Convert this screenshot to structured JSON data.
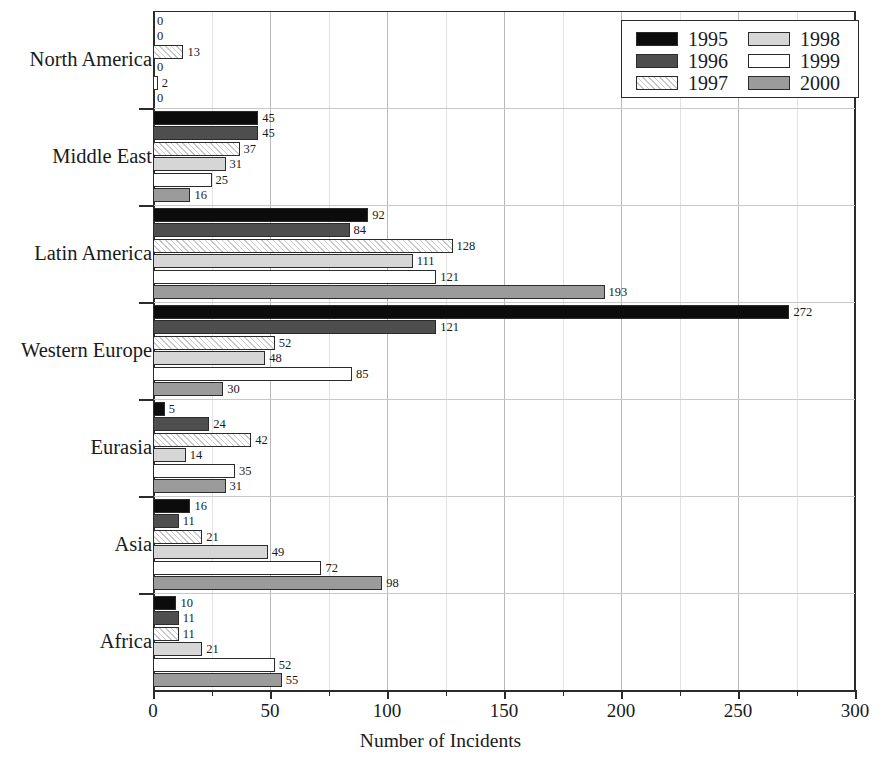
{
  "chart_data": {
    "type": "bar",
    "orientation": "horizontal",
    "title": "",
    "xlabel": "Number of Incidents",
    "ylabel": "",
    "xlim": [
      0,
      300
    ],
    "xticks": [
      0,
      50,
      100,
      150,
      200,
      250,
      300
    ],
    "xtick_labels": [
      "0",
      "50",
      "100",
      "150",
      "200",
      "250",
      "300"
    ],
    "minor_xticks": [
      25,
      75,
      125,
      175,
      225,
      275
    ],
    "grid": true,
    "legend_position": "top-right",
    "categories": [
      "North America",
      "Middle East",
      "Latin America",
      "Western Europe",
      "Eurasia",
      "Asia",
      "Africa"
    ],
    "series": [
      {
        "name": "1995",
        "color": "#0c0c0c",
        "pattern": "solid-black",
        "values": [
          0,
          45,
          92,
          272,
          5,
          16,
          10
        ]
      },
      {
        "name": "1996",
        "color": "#4e4e4e",
        "pattern": "solid-dark-gray",
        "values": [
          0,
          45,
          84,
          121,
          24,
          11,
          11
        ]
      },
      {
        "name": "1997",
        "color": "#ffffff",
        "pattern": "diagonal-hatch",
        "values": [
          13,
          37,
          128,
          52,
          42,
          21,
          11
        ]
      },
      {
        "name": "1998",
        "color": "#d6d6d6",
        "pattern": "solid-light-gray",
        "values": [
          0,
          31,
          111,
          48,
          14,
          49,
          21
        ]
      },
      {
        "name": "1999",
        "color": "#ffffff",
        "pattern": "solid-white",
        "values": [
          2,
          25,
          121,
          85,
          35,
          72,
          52
        ]
      },
      {
        "name": "2000",
        "color": "#9b9b9b",
        "pattern": "solid-medium-gray",
        "values": [
          0,
          16,
          193,
          30,
          31,
          98,
          55
        ]
      }
    ]
  },
  "legend": {
    "entries": [
      {
        "label": "1995"
      },
      {
        "label": "1996"
      },
      {
        "label": "1997"
      },
      {
        "label": "1998"
      },
      {
        "label": "1999"
      },
      {
        "label": "2000"
      }
    ]
  }
}
